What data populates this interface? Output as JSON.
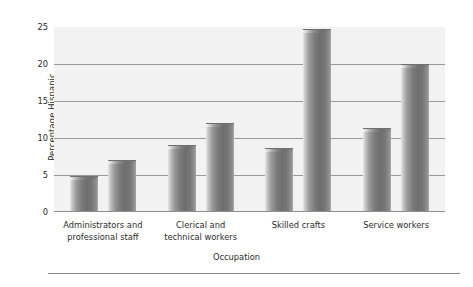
{
  "chart_data": {
    "type": "bar",
    "title": "",
    "xlabel": "Occupation",
    "ylabel": "Percentage Hispanic",
    "categories": [
      "Administrators and professional staff",
      "Clerical and technical workers",
      "Skilled crafts",
      "Service workers"
    ],
    "category_lines": [
      [
        "Administrators and",
        "professional staff"
      ],
      [
        "Clerical and",
        "technical workers"
      ],
      [
        "Skilled crafts"
      ],
      [
        "Service workers"
      ]
    ],
    "series": [
      {
        "name": "Series 1",
        "values": [
          4.8,
          9.0,
          8.7,
          11.4
        ]
      },
      {
        "name": "Series 2",
        "values": [
          7.0,
          12.0,
          24.7,
          20.0
        ]
      }
    ],
    "ylim": [
      0,
      25
    ],
    "yticks": [
      0,
      5,
      10,
      15,
      20,
      25
    ],
    "ytick_labels": [
      "0",
      "5",
      "10",
      "15",
      "20",
      "25"
    ],
    "grid": true,
    "grid_axis": "y",
    "legend": false,
    "legend_position": "none",
    "colors": {
      "bar_light": "#e9e9e9",
      "bar_mid": "#9b9b9b",
      "bar_dark": "#6e6e6e",
      "plot_background": "#f2f2f2",
      "gridline": "#9a9a9a",
      "text": "#2b2b2b"
    }
  }
}
